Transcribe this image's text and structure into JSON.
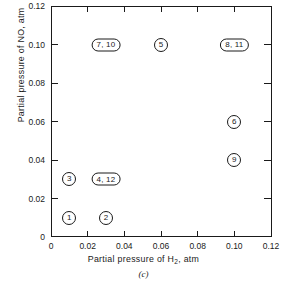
{
  "chart_data": {
    "type": "scatter",
    "title": "",
    "caption": "(c)",
    "xlabel": "Partial pressure of H₂, atm",
    "xlabel_text": "Partial pressure of H",
    "xlabel_sub": "2",
    "xlabel_tail": ", atm",
    "ylabel": "Partial pressure of NO, atm",
    "xlim": [
      0,
      0.12
    ],
    "ylim": [
      0,
      0.12
    ],
    "grid": false,
    "legend": "none",
    "xticks": [
      0,
      0.02,
      0.04,
      0.06,
      0.08,
      0.1,
      0.12
    ],
    "xticklabels": [
      "0",
      "0.02",
      "0.04",
      "0.06",
      "0.08",
      "0.10",
      "0.12"
    ],
    "yticks": [
      0,
      0.02,
      0.04,
      0.06,
      0.08,
      0.1,
      0.12
    ],
    "yticklabels": [
      "0",
      "0.02",
      "0.04",
      "0.06",
      "0.08",
      "0.10",
      "0.12"
    ],
    "points": [
      {
        "label": "1",
        "x": 0.01,
        "y": 0.01,
        "runs": [
          1
        ],
        "style": "single"
      },
      {
        "label": "2",
        "x": 0.03,
        "y": 0.01,
        "runs": [
          2
        ],
        "style": "single"
      },
      {
        "label": "3",
        "x": 0.01,
        "y": 0.03,
        "runs": [
          3
        ],
        "style": "single"
      },
      {
        "label": "4, 12",
        "x": 0.03,
        "y": 0.03,
        "runs": [
          4,
          12
        ],
        "style": "multi"
      },
      {
        "label": "7, 10",
        "x": 0.03,
        "y": 0.1,
        "runs": [
          7,
          10
        ],
        "style": "multi"
      },
      {
        "label": "5",
        "x": 0.06,
        "y": 0.1,
        "runs": [
          5
        ],
        "style": "single"
      },
      {
        "label": "8, 11",
        "x": 0.1,
        "y": 0.1,
        "runs": [
          8,
          11
        ],
        "style": "multi"
      },
      {
        "label": "6",
        "x": 0.1,
        "y": 0.06,
        "runs": [
          6
        ],
        "style": "single"
      },
      {
        "label": "9",
        "x": 0.1,
        "y": 0.04,
        "runs": [
          9
        ],
        "style": "single"
      }
    ]
  }
}
